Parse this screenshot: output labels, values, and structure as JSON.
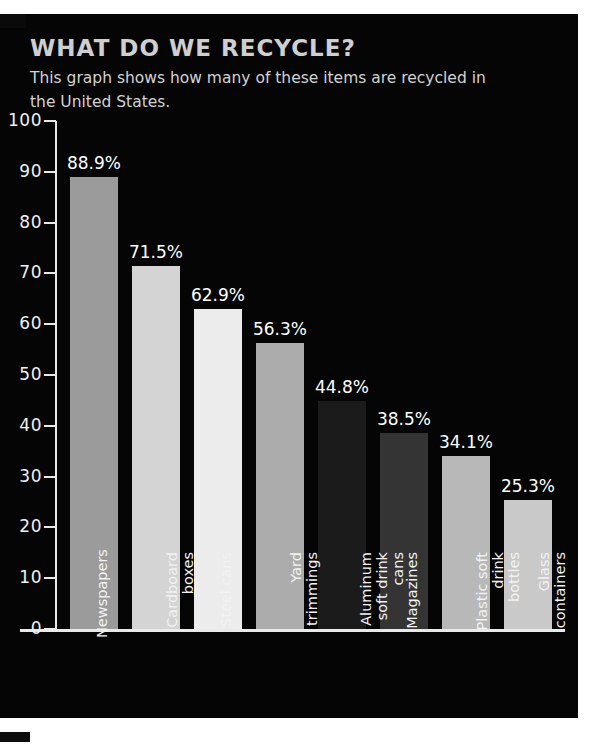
{
  "header": {
    "title": "WHAT DO WE RECYCLE?",
    "subtitle": "This graph shows how many of these items are recycled in the United States."
  },
  "colors": {
    "background": "#050505",
    "page": "#ffffff",
    "title": "#cfcfcf",
    "text": "#f0f0f0",
    "axis": "#e9e9e9"
  },
  "chart_data": {
    "type": "bar",
    "title": "WHAT DO WE RECYCLE?",
    "subtitle": "This graph shows how many of these items are recycled in the United States.",
    "xlabel": "",
    "ylabel": "",
    "ylim": [
      0,
      100
    ],
    "yticks": [
      0,
      10,
      20,
      30,
      40,
      50,
      60,
      70,
      80,
      90,
      100
    ],
    "ytick_labels": [
      "0",
      "10",
      "20",
      "30",
      "40",
      "50",
      "60",
      "70",
      "80",
      "90",
      "100"
    ],
    "grid": false,
    "legend": "none",
    "categories": [
      "Newspapers",
      "Cardboard boxes",
      "Steel cans",
      "Yard trimmings",
      "Aluminum soft drink cans",
      "Magazines",
      "Plastic soft drink bottles",
      "Glass containers"
    ],
    "values": [
      88.9,
      71.5,
      62.9,
      56.3,
      44.8,
      38.5,
      34.1,
      25.3
    ],
    "value_labels": [
      "88.9%",
      "71.5%",
      "62.9%",
      "56.3%",
      "44.8%",
      "38.5%",
      "34.1%",
      "25.3%"
    ],
    "bar_colors": [
      "#9b9b9b",
      "#d4d4d4",
      "#ececec",
      "#acacac",
      "#1b1b1b",
      "#343434",
      "#b8b8b8",
      "#c9c9c9"
    ],
    "category_lines": [
      [
        "Newspapers"
      ],
      [
        "Cardboard",
        "boxes"
      ],
      [
        "Steel cans"
      ],
      [
        "Yard",
        "trimmings"
      ],
      [
        "Aluminum",
        "soft drink",
        "cans"
      ],
      [
        "Magazines"
      ],
      [
        "Plastic soft",
        "drink bottles"
      ],
      [
        "Glass",
        "containers"
      ]
    ]
  }
}
